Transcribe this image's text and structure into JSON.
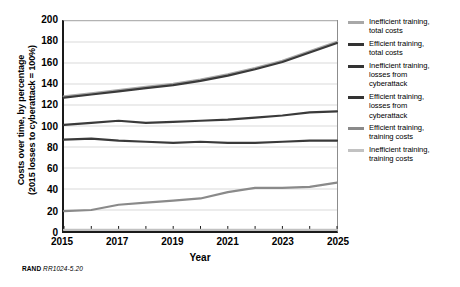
{
  "chart_data": {
    "type": "line",
    "title": "",
    "xlabel": "Year",
    "ylabel": "Costs over time, by percentage (2015 losses to cyberattack = 100%)",
    "ylabel_line1": "Costs over time, by percentage",
    "ylabel_line2": "(2015 losses to cyberattack = 100%)",
    "x": [
      2015,
      2016,
      2017,
      2018,
      2019,
      2020,
      2021,
      2022,
      2023,
      2024,
      2025
    ],
    "xlim": [
      2015,
      2025
    ],
    "ylim": [
      0,
      200
    ],
    "yticks": [
      0,
      20,
      40,
      60,
      80,
      100,
      120,
      140,
      160,
      180,
      200
    ],
    "xticks": [
      2015,
      2016,
      2017,
      2018,
      2019,
      2020,
      2021,
      2022,
      2023,
      2024,
      2025
    ],
    "xtick_labels_shown": [
      2015,
      2017,
      2019,
      2021,
      2023,
      2025
    ],
    "grid": "horizontal",
    "legend_position": "right",
    "series": [
      {
        "name": "Inefficient training, total costs",
        "color": "#a8a8a8",
        "width": 2.6,
        "values": [
          128,
          131,
          134,
          137,
          140,
          144,
          149,
          155,
          162,
          171,
          180
        ]
      },
      {
        "name": "Efficient training, total costs",
        "color": "#3a3a3a",
        "width": 2.2,
        "values": [
          127,
          130,
          133,
          136,
          139,
          143,
          148,
          154,
          161,
          170,
          179
        ]
      },
      {
        "name": "Inefficient training, losses from cyberattack",
        "color": "#3a3a3a",
        "width": 2.2,
        "values": [
          101,
          103,
          105,
          103,
          104,
          105,
          106,
          108,
          110,
          113,
          114
        ]
      },
      {
        "name": "Efficient training, losses from cyberattack",
        "color": "#3a3a3a",
        "width": 2.2,
        "values": [
          87,
          88,
          86,
          85,
          84,
          85,
          84,
          84,
          85,
          86,
          86
        ]
      },
      {
        "name": "Efficient training, training costs",
        "color": "#8a8a8a",
        "width": 2.2,
        "values": [
          19,
          20,
          25,
          27,
          29,
          31,
          37,
          41,
          41,
          42,
          46
        ]
      },
      {
        "name": "Inefficient training, training costs",
        "color": "#c2c2c2",
        "width": 2.2,
        "values": [
          1,
          1,
          1,
          1,
          1,
          1,
          1,
          1,
          1,
          1,
          1
        ]
      }
    ]
  },
  "legend": {
    "items": [
      {
        "label": "Inefficient training,\ntotal costs",
        "swatch": "#a8a8a8"
      },
      {
        "label": "Efficient training,\ntotal costs",
        "swatch": "#333333"
      },
      {
        "label": "Inefficient training,\nlosses from\ncyberattack",
        "swatch": "#333333"
      },
      {
        "label": "Efficient training,\nlosses from\ncyberattack",
        "swatch": "#333333"
      },
      {
        "label": "Efficient training,\ntraining costs",
        "swatch": "#8a8a8a"
      },
      {
        "label": "Inefficient training,\ntraining costs",
        "swatch": "#c2c2c2"
      }
    ]
  },
  "source_note": {
    "prefix": "RAND",
    "id": "RR1024-5.20"
  }
}
